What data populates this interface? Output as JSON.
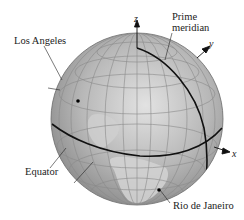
{
  "figure": {
    "title_cropped": "",
    "globe": {
      "center": [
        137,
        119
      ],
      "radius": 86,
      "fill": "#b4b4b4",
      "highlight": "#dcdcdc",
      "gridline_color": "#8a8a8a",
      "feature_line_color": "#111111"
    },
    "axes": {
      "z": "z",
      "y": "y",
      "x": "x"
    },
    "labels": {
      "prime_line1": "Prime",
      "prime_line2": "meridian",
      "los_angeles": "Los Angeles",
      "equator": "Equator",
      "rio": "Rio de Janeiro"
    }
  }
}
